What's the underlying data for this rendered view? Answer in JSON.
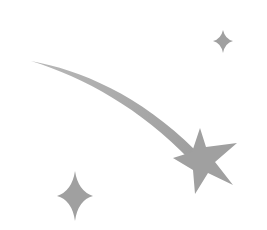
{
  "illustration": {
    "label": "Shooting star icon",
    "colors": {
      "background": "#ffffff",
      "fill": "#a3a3a3",
      "fill_dark": "#9a9a9a"
    },
    "elements": [
      {
        "name": "shooting-star",
        "description": "five-pointed star with curved trailing tail"
      },
      {
        "name": "sparkle-top-right",
        "description": "small four-pointed sparkle"
      },
      {
        "name": "sparkle-bottom-left",
        "description": "four-pointed sparkle"
      }
    ]
  }
}
